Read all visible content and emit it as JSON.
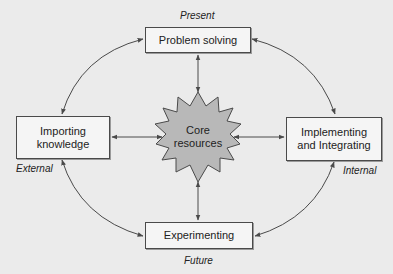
{
  "nodes": {
    "top": {
      "label": "Problem solving"
    },
    "left": {
      "label_line1": "Importing",
      "label_line2": "knowledge"
    },
    "right": {
      "label_line1": "Implementing",
      "label_line2": "and Integrating"
    },
    "bottom": {
      "label": "Experimenting"
    },
    "center": {
      "label_line1": "Core",
      "label_line2": "resources"
    }
  },
  "annotations": {
    "top": "Present",
    "bottom": "Future",
    "left": "External",
    "right": "Internal"
  },
  "colors": {
    "background": "#ebebeb",
    "box_fill": "#f5f5f5",
    "star_fill": "#b8b8b8",
    "line": "#4a4a4a"
  }
}
